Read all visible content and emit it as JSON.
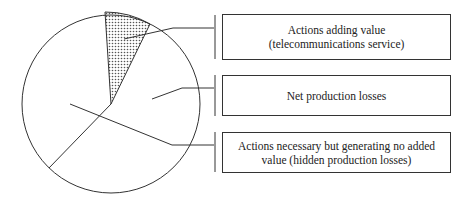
{
  "diagram": {
    "type": "pie-with-callouts",
    "slices": [
      {
        "id": "value-adding",
        "fill": "dotted",
        "label_lines": [
          "Actions adding value",
          "(telecommunications service)"
        ]
      },
      {
        "id": "net-losses",
        "fill": "white",
        "label_lines": [
          "Net production losses"
        ]
      },
      {
        "id": "hidden-losses",
        "fill": "white",
        "label_lines": [
          "Actions necessary but generating no added",
          "value (hidden production losses)"
        ]
      }
    ],
    "colors": {
      "stroke": "#333333",
      "fill": "#ffffff",
      "dots": "#555555"
    }
  }
}
